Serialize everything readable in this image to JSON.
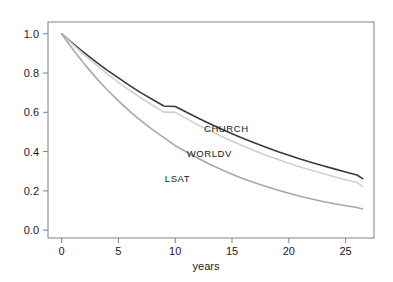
{
  "chart_data": {
    "type": "line",
    "title": "",
    "subtitle": "",
    "xlabel": "years",
    "ylabel": "",
    "xlim": [
      -1.2,
      27.5
    ],
    "ylim": [
      -0.04,
      1.06
    ],
    "xticks": [
      0,
      5,
      10,
      15,
      20,
      25
    ],
    "xtick_labels": [
      "0",
      "5",
      "10",
      "15",
      "20",
      "25"
    ],
    "yticks": [
      0.0,
      0.2,
      0.4,
      0.6,
      0.8,
      1.0
    ],
    "ytick_labels": [
      "0.0",
      "0.2",
      "0.4",
      "0.6",
      "0.8",
      "1.0"
    ],
    "grid": false,
    "legend_position": "inline-annotations",
    "x": [
      0,
      1,
      2,
      3,
      4,
      5,
      6,
      7,
      8,
      9,
      10,
      11,
      12,
      13,
      14,
      15,
      16,
      17,
      18,
      19,
      20,
      21,
      22,
      23,
      24,
      25,
      26,
      26.5
    ],
    "series": [
      {
        "name": "CHURCH",
        "color": "#3a3a3a",
        "label_x": 14.5,
        "label_y": 0.5,
        "values": [
          1.0,
          0.95,
          0.903,
          0.858,
          0.815,
          0.775,
          0.736,
          0.699,
          0.665,
          0.632,
          0.63,
          0.6,
          0.571,
          0.543,
          0.516,
          0.491,
          0.467,
          0.444,
          0.422,
          0.401,
          0.381,
          0.362,
          0.345,
          0.328,
          0.312,
          0.296,
          0.281,
          0.262
        ]
      },
      {
        "name": "WORLDV",
        "color": "#d0d0d0",
        "label_x": 13.0,
        "label_y": 0.375,
        "values": [
          1.0,
          0.945,
          0.893,
          0.844,
          0.797,
          0.753,
          0.712,
          0.673,
          0.636,
          0.601,
          0.6,
          0.568,
          0.536,
          0.507,
          0.479,
          0.453,
          0.428,
          0.404,
          0.382,
          0.361,
          0.341,
          0.322,
          0.305,
          0.288,
          0.272,
          0.257,
          0.243,
          0.222
        ]
      },
      {
        "name": "LSAT",
        "color": "#a8a8a8",
        "label_x": 10.2,
        "label_y": 0.245,
        "values": [
          1.0,
          0.92,
          0.846,
          0.778,
          0.715,
          0.658,
          0.605,
          0.556,
          0.512,
          0.471,
          0.43,
          0.398,
          0.366,
          0.337,
          0.31,
          0.285,
          0.262,
          0.241,
          0.222,
          0.204,
          0.188,
          0.173,
          0.159,
          0.146,
          0.134,
          0.124,
          0.115,
          0.108
        ]
      }
    ]
  }
}
